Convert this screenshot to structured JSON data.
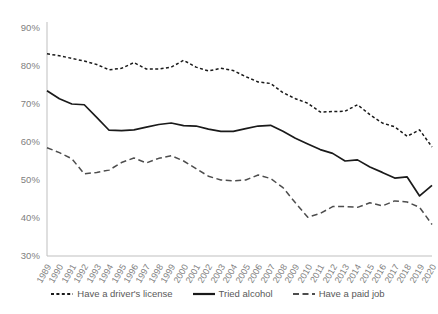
{
  "chart_data": {
    "type": "line",
    "title": "",
    "xlabel": "",
    "ylabel": "",
    "ylim": [
      30,
      90
    ],
    "ytick_values": [
      90,
      80,
      70,
      60,
      50,
      40,
      30
    ],
    "ytick_labels": [
      "90%",
      "80%",
      "70%",
      "60%",
      "50%",
      "40%",
      "30%"
    ],
    "grid": false,
    "legend_position": "bottom",
    "categories": [
      "1989",
      "1990",
      "1991",
      "1992",
      "1993",
      "1994",
      "1995",
      "1996",
      "1997",
      "1998",
      "1999",
      "2000",
      "2001",
      "2002",
      "2003",
      "2004",
      "2005",
      "2006",
      "2007",
      "2008",
      "2009",
      "2010",
      "2011",
      "2012",
      "2013",
      "2014",
      "2015",
      "2016",
      "2017",
      "2018",
      "2019",
      "2020"
    ],
    "series": [
      {
        "name": "Have a driver's license",
        "style": "dotted",
        "color": "#1a1a1a",
        "values": [
          83.2,
          82.7,
          82.0,
          81.3,
          80.4,
          79.0,
          79.4,
          80.9,
          79.2,
          79.2,
          79.7,
          81.5,
          79.7,
          78.7,
          79.4,
          78.8,
          77.2,
          75.8,
          75.4,
          73.0,
          71.4,
          70.2,
          67.9,
          68.0,
          68.1,
          69.8,
          67.2,
          65.0,
          64.0,
          61.5,
          63.2,
          58.7
        ]
      },
      {
        "name": "Tried alcohol",
        "style": "solid",
        "color": "#1a1a1a",
        "values": [
          73.5,
          71.4,
          70.0,
          69.8,
          66.5,
          63.1,
          63.0,
          63.2,
          63.9,
          64.6,
          65.0,
          64.3,
          64.2,
          63.4,
          62.8,
          62.8,
          63.5,
          64.2,
          64.4,
          62.8,
          61.0,
          59.5,
          58.0,
          57.0,
          55.0,
          55.3,
          53.4,
          52.0,
          50.5,
          50.8,
          45.8,
          48.6
        ]
      },
      {
        "name": "Have a paid job",
        "style": "dashed",
        "color": "#4d4d4d",
        "values": [
          58.5,
          57.2,
          55.6,
          51.6,
          52.0,
          52.6,
          54.6,
          55.8,
          54.5,
          55.7,
          56.4,
          55.0,
          53.0,
          51.0,
          50.0,
          49.8,
          50.0,
          51.3,
          50.4,
          48.0,
          44.0,
          40.2,
          41.2,
          43.0,
          43.0,
          42.8,
          44.0,
          43.2,
          44.5,
          44.2,
          42.8,
          38.3
        ]
      }
    ]
  },
  "legend": {
    "items": [
      {
        "label": "Have a driver's license",
        "style": "dotted"
      },
      {
        "label": "Tried alcohol",
        "style": "solid"
      },
      {
        "label": "Have a paid job",
        "style": "dashed"
      }
    ]
  },
  "colors": {
    "axis_text": "#808080",
    "legend_text": "#595959",
    "line_dark": "#1a1a1a",
    "line_mid": "#4d4d4d",
    "background": "#ffffff"
  }
}
